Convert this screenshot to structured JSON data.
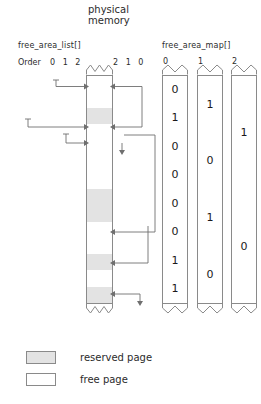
{
  "title": {
    "line1": "physical",
    "line2": "memory"
  },
  "headers": {
    "free_area_list": "free_area_list[]",
    "free_area_map": "free_area_map[]"
  },
  "order_axis": {
    "label": "Order",
    "left_orders": "0 1 2",
    "right_orders": "2 1 0"
  },
  "memory": {
    "cell_count": 14,
    "cells": [
      {
        "index": 0,
        "state": "free"
      },
      {
        "index": 1,
        "state": "free"
      },
      {
        "index": 2,
        "state": "reserved"
      },
      {
        "index": 3,
        "state": "free"
      },
      {
        "index": 4,
        "state": "free"
      },
      {
        "index": 5,
        "state": "free"
      },
      {
        "index": 6,
        "state": "free"
      },
      {
        "index": 7,
        "state": "reserved"
      },
      {
        "index": 8,
        "state": "reserved"
      },
      {
        "index": 9,
        "state": "free"
      },
      {
        "index": 10,
        "state": "free"
      },
      {
        "index": 11,
        "state": "reserved"
      },
      {
        "index": 12,
        "state": "free"
      },
      {
        "index": 13,
        "state": "reserved"
      }
    ]
  },
  "map_columns": [
    {
      "label": "0",
      "values": [
        "0",
        "1",
        "0",
        "0",
        "0",
        "0",
        "1",
        "1"
      ]
    },
    {
      "label": "1",
      "values": [
        "1",
        "0",
        "1",
        "0"
      ]
    },
    {
      "label": "2",
      "values": [
        "1",
        "0"
      ]
    }
  ],
  "legend": [
    {
      "swatch": "reserved",
      "text": "reserved page"
    },
    {
      "swatch": "free",
      "text": "free page"
    }
  ],
  "colors": {
    "reserved_fill": "#e3e3e3",
    "free_fill": "#ffffff",
    "line": "#8a8a8a",
    "text": "#2b2b2b"
  }
}
